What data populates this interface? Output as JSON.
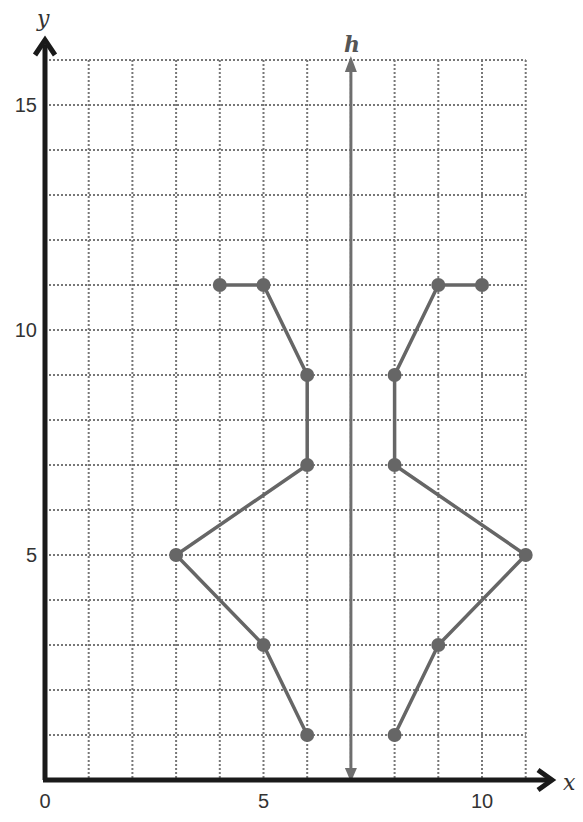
{
  "chart_data": {
    "type": "scatter",
    "title": "",
    "xlabel": "x",
    "ylabel": "y",
    "xlim": [
      0,
      11
    ],
    "ylim": [
      0,
      16
    ],
    "grid": true,
    "x_ticks": [
      0,
      5,
      10
    ],
    "y_ticks": [
      5,
      10,
      15
    ],
    "x_tick_labels": [
      "0",
      "5",
      "10"
    ],
    "y_tick_labels": [
      "5",
      "10",
      "15"
    ],
    "line_of_reflection": {
      "label": "h",
      "x": 7
    },
    "series": [
      {
        "name": "left figure",
        "points": [
          [
            4,
            11
          ],
          [
            5,
            11
          ],
          [
            6,
            9
          ],
          [
            6,
            7
          ],
          [
            3,
            5
          ],
          [
            5,
            3
          ],
          [
            6,
            1
          ]
        ]
      },
      {
        "name": "right figure (reflection over h)",
        "points": [
          [
            10,
            11
          ],
          [
            9,
            11
          ],
          [
            8,
            9
          ],
          [
            8,
            7
          ],
          [
            11,
            5
          ],
          [
            9,
            3
          ],
          [
            8,
            1
          ]
        ]
      }
    ]
  },
  "colors": {
    "axis": "#1a1a1a",
    "grid": "#777777",
    "figure": "#666666",
    "line_h": "#6e6e6e"
  }
}
